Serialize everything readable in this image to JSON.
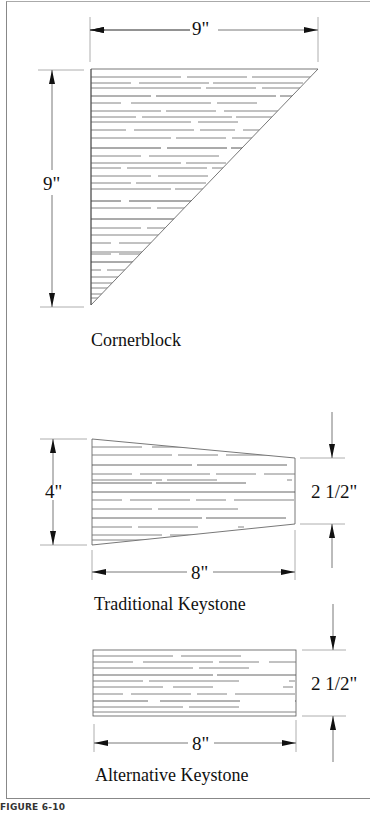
{
  "figure": {
    "label": "FIGURE 6-10"
  },
  "cornerblock": {
    "caption": "Cornerblock",
    "width_dim": "9\"",
    "height_dim": "9\""
  },
  "traditional_keystone": {
    "caption": "Traditional Keystone",
    "left_height_dim": "4\"",
    "right_height_dim": "2 1/2\"",
    "length_dim": "8\""
  },
  "alternative_keystone": {
    "caption": "Alternative Keystone",
    "height_dim": "2 1/2\"",
    "length_dim": "8\""
  },
  "colors": {
    "line": "#222222",
    "hatch": "#777777",
    "frame": "#888888"
  }
}
